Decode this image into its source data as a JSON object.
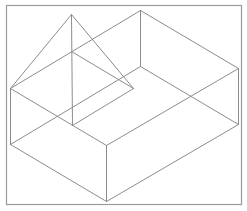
{
  "diagram": {
    "title": "",
    "type": "isometric-wireframe",
    "line_color": "#8c8c8c",
    "frame_color": "#9a9a9a",
    "background": "#ffffff",
    "frame": {
      "x": 6,
      "y": 5,
      "width": 235,
      "height": 199
    },
    "vertices": {
      "box_top_left": [
        10,
        88
      ],
      "box_top_back": [
        140,
        10
      ],
      "box_top_right": [
        238,
        68
      ],
      "box_top_front": [
        106,
        145
      ],
      "box_bottom_left": [
        10,
        144
      ],
      "box_bottom_back": [
        140,
        66
      ],
      "box_bottom_right": [
        238,
        124
      ],
      "box_bottom_front": [
        106,
        201
      ],
      "pyramid_apex": [
        71,
        14
      ],
      "pyramid_base_back": [
        71,
        51
      ],
      "pyramid_base_right": [
        133,
        88
      ],
      "pyramid_base_front": [
        72,
        125
      ]
    },
    "edges": [
      {
        "name": "box-top-left-back",
        "from": "box_top_left",
        "to": "box_top_back"
      },
      {
        "name": "box-top-back-right",
        "from": "box_top_back",
        "to": "box_top_right"
      },
      {
        "name": "box-top-right-front",
        "from": "box_top_right",
        "to": "box_top_front"
      },
      {
        "name": "box-top-front-left",
        "from": "box_top_front",
        "to": "box_top_left"
      },
      {
        "name": "box-bottom-left-back",
        "from": "box_bottom_left",
        "to": "box_bottom_back"
      },
      {
        "name": "box-bottom-back-right",
        "from": "box_bottom_back",
        "to": "box_bottom_right"
      },
      {
        "name": "box-bottom-right-front",
        "from": "box_bottom_right",
        "to": "box_bottom_front"
      },
      {
        "name": "box-bottom-front-left",
        "from": "box_bottom_front",
        "to": "box_bottom_left"
      },
      {
        "name": "box-vertical-left",
        "from": "box_top_left",
        "to": "box_bottom_left"
      },
      {
        "name": "box-vertical-back",
        "from": "box_top_back",
        "to": "box_bottom_back"
      },
      {
        "name": "box-vertical-right",
        "from": "box_top_right",
        "to": "box_bottom_right"
      },
      {
        "name": "box-vertical-front",
        "from": "box_top_front",
        "to": "box_bottom_front"
      },
      {
        "name": "pyramid-apex-left",
        "from": "pyramid_apex",
        "to": "box_top_left"
      },
      {
        "name": "pyramid-apex-right",
        "from": "pyramid_apex",
        "to": "pyramid_base_right"
      },
      {
        "name": "pyramid-apex-vertical",
        "from": "pyramid_apex",
        "to": "pyramid_base_front"
      },
      {
        "name": "pyramid-base-back-right",
        "from": "pyramid_base_back",
        "to": "pyramid_base_right"
      },
      {
        "name": "pyramid-base-right-front",
        "from": "pyramid_base_right",
        "to": "pyramid_base_front"
      }
    ]
  }
}
